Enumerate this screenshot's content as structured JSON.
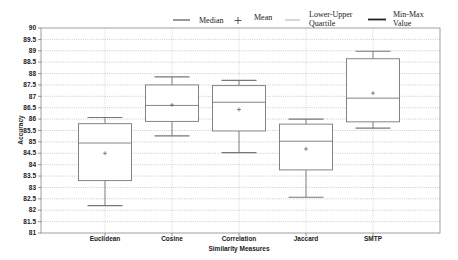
{
  "chart_data": {
    "type": "box",
    "title": "",
    "xlabel": "Similarity Measures",
    "ylabel": "Accuracy",
    "ylim": [
      81,
      90
    ],
    "yticks": [
      81,
      81.5,
      82,
      82.5,
      83,
      83.5,
      84,
      84.5,
      85,
      85.5,
      86,
      86.5,
      87,
      87.5,
      88,
      88.5,
      89,
      89.5,
      90
    ],
    "grid": true,
    "legend_position": "top-right",
    "legend": [
      {
        "label": "Median",
        "symbol": "line"
      },
      {
        "label": "Mean",
        "symbol": "plus"
      },
      {
        "label": "Lower-Upper Quartile",
        "symbol": "thin-line"
      },
      {
        "label": "Min-Max Value",
        "symbol": "thick-line"
      }
    ],
    "categories": [
      "Euclidean",
      "Cosine",
      "Correlation",
      "Jaccard",
      "SMTP"
    ],
    "series": [
      {
        "name": "Euclidean",
        "min": 82.2,
        "q1": 83.3,
        "median": 84.95,
        "mean": 84.5,
        "q3": 85.8,
        "max": 86.07
      },
      {
        "name": "Cosine",
        "min": 85.26,
        "q1": 85.9,
        "median": 86.6,
        "mean": 86.62,
        "q3": 87.5,
        "max": 87.85
      },
      {
        "name": "Correlation",
        "min": 84.53,
        "q1": 85.48,
        "median": 86.74,
        "mean": 86.42,
        "q3": 87.47,
        "max": 87.7
      },
      {
        "name": "Jaccard",
        "min": 82.57,
        "q1": 83.77,
        "median": 85.03,
        "mean": 84.69,
        "q3": 85.78,
        "max": 86.0
      },
      {
        "name": "SMTP",
        "min": 85.6,
        "q1": 85.88,
        "median": 86.92,
        "mean": 87.14,
        "q3": 88.65,
        "max": 88.98
      }
    ]
  },
  "legend": {
    "median": "Median",
    "mean": "Mean",
    "quartile_line1": "Lower-Upper",
    "quartile_line2": "Quartile",
    "minmax_line1": "Min-Max",
    "minmax_line2": "Value"
  },
  "axes": {
    "xlabel": "Similarity Measures",
    "ylabel": "Accuracy"
  }
}
